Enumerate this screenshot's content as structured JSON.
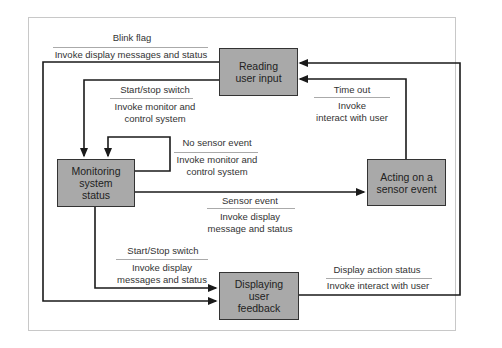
{
  "diagram": {
    "type": "state-transition",
    "states": [
      {
        "id": "reading",
        "label": "Reading\nuser input"
      },
      {
        "id": "monitoring",
        "label": "Monitoring\nsystem\nstatus"
      },
      {
        "id": "acting",
        "label": "Acting on a\nsensor event"
      },
      {
        "id": "displaying",
        "label": "Displaying\nuser\nfeedback"
      }
    ],
    "transitions": [
      {
        "from": "reading",
        "to": "displaying",
        "event": "Blink flag",
        "action": "Invoke display messages and status"
      },
      {
        "from": "reading",
        "to": "monitoring",
        "event": "Start/stop switch",
        "action": "Invoke monitor and\ncontrol system"
      },
      {
        "from": "monitoring",
        "to": "monitoring",
        "event": "No sensor event",
        "action": "Invoke monitor and\ncontrol system"
      },
      {
        "from": "monitoring",
        "to": "acting",
        "event": "Sensor event",
        "action": "Invoke display\nmessage and status"
      },
      {
        "from": "acting",
        "to": "reading",
        "event": "Time out",
        "action": "Invoke\ninteract with user"
      },
      {
        "from": "monitoring",
        "to": "displaying",
        "event": "Start/Stop switch",
        "action": "Invoke display\nmessages and status"
      },
      {
        "from": "displaying",
        "to": "reading",
        "event": "Display action status",
        "action": "Invoke interact with user"
      }
    ]
  },
  "colors": {
    "state_fill": "#a9a9a9",
    "line": "#1a1a1a",
    "rule": "#aaaaaa",
    "frame": "#c8c8c8"
  }
}
